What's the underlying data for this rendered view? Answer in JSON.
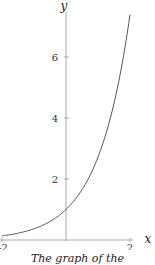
{
  "chart_data": {
    "type": "line",
    "title": "",
    "xlabel": "x",
    "ylabel": "y",
    "xlim": [
      -2,
      2.2
    ],
    "ylim": [
      0,
      7.4
    ],
    "x_ticks": [
      -2,
      2
    ],
    "x_tick_labels": [
      "-2",
      "2"
    ],
    "y_ticks": [
      2,
      4,
      6
    ],
    "y_tick_labels": [
      "2",
      "4",
      "6"
    ],
    "grid": false,
    "legend": null,
    "series": [
      {
        "name": "y = e^x",
        "x": [
          -2,
          -1.5,
          -1,
          -0.5,
          0,
          0.5,
          1,
          1.5,
          1.75,
          2
        ],
        "values": [
          0.135,
          0.223,
          0.368,
          0.607,
          1.0,
          1.649,
          2.718,
          4.482,
          5.755,
          7.389
        ]
      }
    ],
    "caption": "The graph of the"
  },
  "colors": {
    "axis": "#aaaaaa",
    "curve": "#555555",
    "text": "#222222"
  }
}
